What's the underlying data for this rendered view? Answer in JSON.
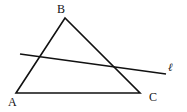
{
  "diagram": {
    "title": "",
    "vertices": {
      "A": {
        "label": "A",
        "x": 16,
        "y": 93
      },
      "B": {
        "label": "B",
        "x": 65,
        "y": 18
      },
      "C": {
        "label": "C",
        "x": 140,
        "y": 93
      }
    },
    "line": {
      "label": "ℓ",
      "x1": 20,
      "y1": 54,
      "x2": 166,
      "y2": 74
    },
    "stroke_color": "#111111"
  }
}
